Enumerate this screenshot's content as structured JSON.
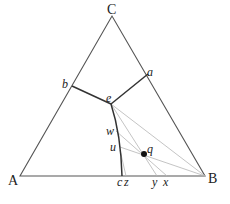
{
  "diagram": {
    "type": "ternary phase diagram",
    "vertices": {
      "A": {
        "label": "A",
        "x": 20,
        "y": 176
      },
      "B": {
        "label": "B",
        "x": 205,
        "y": 176
      },
      "C": {
        "label": "C",
        "x": 112,
        "y": 16
      }
    },
    "points": {
      "a": {
        "label": "a",
        "x": 148,
        "y": 74
      },
      "b": {
        "label": "b",
        "x": 72,
        "y": 86
      },
      "e": {
        "label": "e",
        "x": 111,
        "y": 104
      },
      "w": {
        "label": "w",
        "x": 116,
        "y": 131
      },
      "u": {
        "label": "u",
        "x": 120,
        "y": 147
      },
      "q": {
        "label": "q",
        "x": 144,
        "y": 154
      },
      "c": {
        "label": "c",
        "x": 122,
        "y": 176
      },
      "z": {
        "label": "z",
        "x": 126,
        "y": 176
      },
      "y": {
        "label": "y",
        "x": 157,
        "y": 176
      },
      "x": {
        "label": "x",
        "x": 167,
        "y": 176
      }
    },
    "colors": {
      "outline": "#555555",
      "boundary": "#333333",
      "tieline": "#b0b0b0",
      "dot": "#111111"
    }
  }
}
